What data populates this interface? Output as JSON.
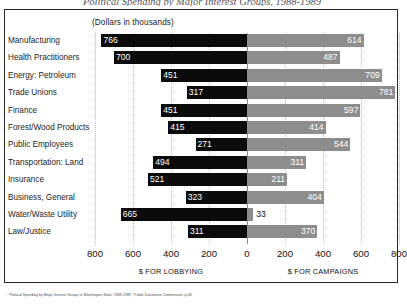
{
  "title": "Political Spending by Major Interest Groups, 1988-1989",
  "subtitle": "(Dollars in thousands)",
  "axis": {
    "left_label": "$ FOR LOBBYING",
    "right_label": "$ FOR CAMPAIGNS",
    "ticks": [
      "800",
      "600",
      "400",
      "200",
      "0",
      "200",
      "400",
      "600",
      "800"
    ]
  },
  "footnote": "¹ \"Political Spending by Major Interest Groups in Washington State, 1988-1989,\" Public Disclosure Commission, p.48.",
  "chart_data": {
    "type": "bar",
    "orientation": "horizontal-diverging",
    "title": "Political Spending by Major Interest Groups, 1988-1989",
    "subtitle": "(Dollars in thousands)",
    "xlabel_left": "$ FOR LOBBYING",
    "xlabel_right": "$ FOR CAMPAIGNS",
    "ylabel": "",
    "units": "thousands of dollars",
    "xlim_left": [
      0,
      800
    ],
    "xlim_right": [
      0,
      800
    ],
    "tick_interval": 200,
    "grid": true,
    "legend": "none",
    "categories": [
      "Manufacturing",
      "Health Practitioners",
      "Energy: Petroleum",
      "Trade Unions",
      "Finance",
      "Forest/Wood Products",
      "Public Employees",
      "Transportation: Land",
      "Insurance",
      "Business, General",
      "Water/Waste Utility",
      "Law/Justice"
    ],
    "series": [
      {
        "name": "$ FOR LOBBYING",
        "side": "left",
        "color": "#0b0b0b",
        "values": [
          766,
          700,
          451,
          317,
          451,
          415,
          271,
          494,
          521,
          323,
          665,
          311
        ]
      },
      {
        "name": "$ FOR CAMPAIGNS",
        "side": "right",
        "color": "#8d8d8d",
        "values": [
          614,
          487,
          709,
          781,
          597,
          414,
          544,
          311,
          211,
          404,
          33,
          370
        ]
      }
    ]
  }
}
